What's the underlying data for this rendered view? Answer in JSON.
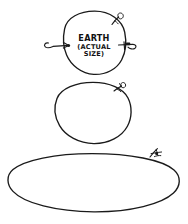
{
  "canvas": {
    "width": 188,
    "height": 224,
    "background_color": "#ffffff",
    "ink_color": "#1a1a1a",
    "style": "hand-drawn-sketch"
  },
  "figure": {
    "title_visible": false,
    "shape_count": 3,
    "caption": {
      "line1": "EARTH",
      "line2": "(ACTUAL",
      "line3": "SIZE)",
      "full_text": "EARTH (ACTUAL SIZE)"
    },
    "shapes": [
      {
        "id": "earth-circle",
        "kind": "circle",
        "label": "EARTH (ACTUAL SIZE)",
        "has_label": true,
        "cx": 94,
        "cy": 43,
        "rx": 30,
        "ry": 32,
        "marks": [
          "left-arrow-mark",
          "right-arrow-mark",
          "top-right-curl-mark"
        ]
      },
      {
        "id": "middle-circle",
        "kind": "circle",
        "label": "",
        "has_label": false,
        "cx": 93,
        "cy": 113,
        "rx": 38,
        "ry": 31,
        "marks": [
          "top-right-curl-mark"
        ]
      },
      {
        "id": "bottom-ellipse",
        "kind": "ellipse",
        "label": "",
        "has_label": false,
        "cx": 92,
        "cy": 185,
        "rx": 83,
        "ry": 31,
        "marks": [
          "top-right-bird-mark"
        ]
      }
    ],
    "annotations": [
      {
        "id": "left-arrow-mark",
        "name": "left-arrow",
        "target": "earth-circle",
        "direction": "right",
        "x": 50,
        "y": 45
      },
      {
        "id": "right-arrow-mark",
        "name": "right-arrow",
        "target": "earth-circle",
        "direction": "left",
        "x": 128,
        "y": 45
      },
      {
        "id": "top-right-curl-mark",
        "name": "curl-squiggle",
        "target": "earth-circle",
        "x": 119,
        "y": 17
      },
      {
        "id": "middle-curl-mark",
        "name": "curl-squiggle",
        "target": "middle-circle",
        "x": 122,
        "y": 86
      },
      {
        "id": "top-right-bird-mark",
        "name": "bird-squiggle",
        "target": "bottom-ellipse",
        "x": 156,
        "y": 151
      }
    ]
  }
}
